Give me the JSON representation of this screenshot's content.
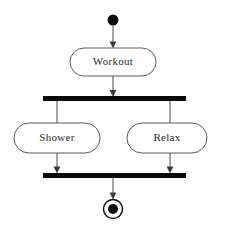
{
  "diagram": {
    "type": "uml-activity-diagram",
    "title": "",
    "background_color": "#ffffff",
    "line_color": "#4a4a4a",
    "bar_color": "#0a0a0a",
    "node_fill": "#ffffff",
    "node_stroke": "#5a5a5a",
    "text_color": "#2b2b2b",
    "nodes": [
      {
        "id": "start",
        "kind": "initial-node",
        "label": "",
        "cx": 113,
        "cy": 20,
        "r": 5.5
      },
      {
        "id": "workout",
        "kind": "action",
        "label": "Workout",
        "x": 70,
        "y": 48,
        "width": 86,
        "height": 28,
        "rx": 14
      },
      {
        "id": "fork",
        "kind": "fork-bar",
        "label": "",
        "x": 43,
        "y": 96,
        "width": 143,
        "height": 5
      },
      {
        "id": "shower",
        "kind": "action",
        "label": "Shower",
        "x": 14,
        "y": 123,
        "width": 86,
        "height": 30,
        "rx": 15
      },
      {
        "id": "relax",
        "kind": "action",
        "label": "Relax",
        "x": 127,
        "y": 123,
        "width": 80,
        "height": 30,
        "rx": 15
      },
      {
        "id": "join",
        "kind": "join-bar",
        "label": "",
        "x": 43,
        "y": 173,
        "width": 143,
        "height": 5
      },
      {
        "id": "end",
        "kind": "final-node",
        "label": "",
        "cx": 113,
        "cy": 209,
        "outer_r": 9.5,
        "inner_r": 5
      }
    ],
    "edges": [
      {
        "id": "start-to-workout",
        "from": "start",
        "to": "workout",
        "arrow": true
      },
      {
        "id": "workout-to-fork",
        "from": "workout",
        "to": "fork",
        "arrow": true
      },
      {
        "id": "fork-to-shower",
        "from": "fork",
        "to": "shower",
        "arrow": false
      },
      {
        "id": "fork-to-relax",
        "from": "fork",
        "to": "relax",
        "arrow": false
      },
      {
        "id": "shower-to-join",
        "from": "shower",
        "to": "join",
        "arrow": true
      },
      {
        "id": "relax-to-join",
        "from": "relax",
        "to": "join",
        "arrow": true
      },
      {
        "id": "join-to-end",
        "from": "join",
        "to": "end",
        "arrow": true
      }
    ]
  }
}
